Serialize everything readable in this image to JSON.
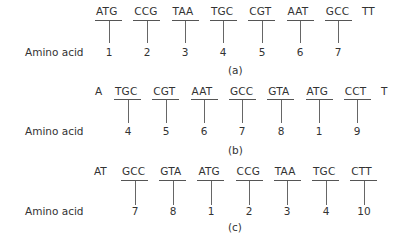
{
  "row_label": "Amino acid",
  "panels": [
    {
      "id": "a",
      "caption": "(a)",
      "prefix": "",
      "suffix": "TT",
      "codons": [
        "ATG",
        "CCG",
        "TAA",
        "TGC",
        "CGT",
        "AAT",
        "GCC"
      ],
      "amino_acids": [
        "1",
        "2",
        "3",
        "4",
        "5",
        "6",
        "7"
      ]
    },
    {
      "id": "b",
      "caption": "(b)",
      "prefix": "A",
      "suffix": "T",
      "codons": [
        "TGC",
        "CGT",
        "AAT",
        "GCC",
        "GTA",
        "ATG",
        "CCT"
      ],
      "amino_acids": [
        "4",
        "5",
        "6",
        "7",
        "8",
        "1",
        "9"
      ]
    },
    {
      "id": "c",
      "caption": "(c)",
      "prefix": "AT",
      "suffix": "",
      "codons": [
        "GCC",
        "GTA",
        "ATG",
        "CCG",
        "TAA",
        "TGC",
        "CTT"
      ],
      "amino_acids": [
        "7",
        "8",
        "1",
        "2",
        "3",
        "4",
        "10"
      ]
    }
  ]
}
